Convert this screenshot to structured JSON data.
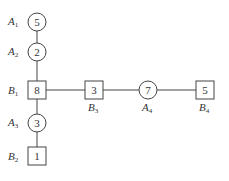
{
  "diagram": {
    "nodes": [
      {
        "id": "A1",
        "shape": "circle",
        "value": "5",
        "label": "A",
        "sub": "1"
      },
      {
        "id": "A2",
        "shape": "circle",
        "value": "2",
        "label": "A",
        "sub": "2"
      },
      {
        "id": "B1",
        "shape": "square",
        "value": "8",
        "label": "B",
        "sub": "1"
      },
      {
        "id": "A3",
        "shape": "circle",
        "value": "3",
        "label": "A",
        "sub": "3"
      },
      {
        "id": "B2",
        "shape": "square",
        "value": "1",
        "label": "B",
        "sub": "2"
      },
      {
        "id": "B3",
        "shape": "square",
        "value": "3",
        "label": "B",
        "sub": "3"
      },
      {
        "id": "A4",
        "shape": "circle",
        "value": "7",
        "label": "A",
        "sub": "4"
      },
      {
        "id": "B4",
        "shape": "square",
        "value": "5",
        "label": "B",
        "sub": "4"
      }
    ],
    "edges": [
      [
        "A1",
        "A2"
      ],
      [
        "A2",
        "B1"
      ],
      [
        "B1",
        "A3"
      ],
      [
        "A3",
        "B2"
      ],
      [
        "B1",
        "B3"
      ],
      [
        "B3",
        "A4"
      ],
      [
        "A4",
        "B4"
      ]
    ]
  }
}
